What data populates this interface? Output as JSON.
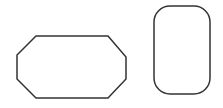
{
  "canvas": {
    "width": 223,
    "height": 108,
    "background": "#ffffff"
  },
  "stroke": {
    "color": "#333333",
    "width": 1.5
  },
  "shapes": [
    {
      "type": "octagon",
      "name": "octagon-shape",
      "points": "36,36 108,36 126,57 126,79 108,98 36,98 17,79 17,55",
      "fill": "none"
    },
    {
      "type": "rounded-rectangle",
      "name": "rounded-rectangle-shape",
      "x": 154,
      "y": 6,
      "width": 56,
      "height": 88,
      "rx": 16,
      "fill": "none"
    }
  ]
}
